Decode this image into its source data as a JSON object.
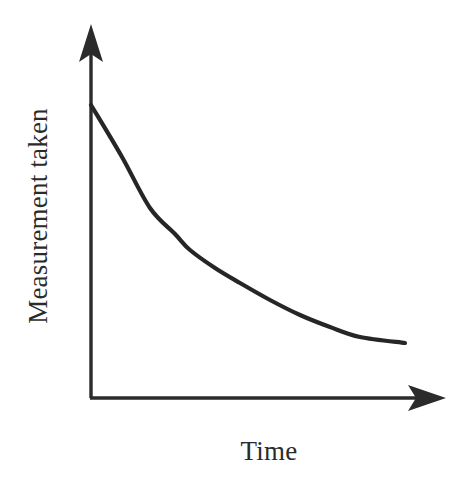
{
  "figure": {
    "background_color": "#ffffff",
    "ink_color": "#2b2b2b",
    "width": 467,
    "height": 479
  },
  "axes": {
    "y_axis_label": "Measurement taken",
    "x_axis_label": "Time",
    "y_axis_arrow_icon": "arrow-up-icon",
    "x_axis_arrow_icon": "arrow-right-icon",
    "origin": {
      "x": 91,
      "y": 398
    },
    "y_axis_tip": {
      "x": 91,
      "y": 25
    },
    "x_axis_tip": {
      "x": 445,
      "y": 398
    },
    "line_width": 3,
    "tick_labels_x": [],
    "tick_labels_y": [],
    "grid": false
  },
  "chart_data": {
    "type": "line",
    "title": "",
    "subtitle": "",
    "xlabel": "Time",
    "ylabel": "Measurement taken",
    "grid": false,
    "legend": [],
    "legend_position": "none",
    "xlim": [
      0,
      1
    ],
    "ylim": [
      0,
      1
    ],
    "x_tick_labels": [],
    "y_tick_labels": [],
    "annotations": [],
    "curve_color": "#262626",
    "curve_width": 4.2,
    "series": [
      {
        "name": "Measurement taken",
        "x": [
          0.0,
          0.1,
          0.19,
          0.27,
          0.35,
          0.47,
          0.56,
          0.66,
          0.76,
          0.86,
          0.95,
          1.0
        ],
        "y": [
          1.0,
          0.78,
          0.63,
          0.52,
          0.43,
          0.33,
          0.26,
          0.19,
          0.13,
          0.08,
          0.03,
          0.0
        ],
        "pixels": [
          {
            "x": 91,
            "y": 105
          },
          {
            "x": 122,
            "y": 157
          },
          {
            "x": 150,
            "y": 208
          },
          {
            "x": 175,
            "y": 234
          },
          {
            "x": 190,
            "y": 250
          },
          {
            "x": 215,
            "y": 268
          },
          {
            "x": 240,
            "y": 283
          },
          {
            "x": 270,
            "y": 300
          },
          {
            "x": 300,
            "y": 315
          },
          {
            "x": 330,
            "y": 327
          },
          {
            "x": 360,
            "y": 337
          },
          {
            "x": 405,
            "y": 343
          }
        ]
      }
    ]
  }
}
